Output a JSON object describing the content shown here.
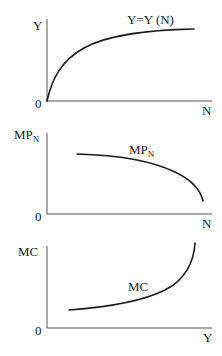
{
  "panels": [
    {
      "id": "production-function",
      "y_axis_label": "Y",
      "x_axis_label": "N",
      "origin_label": "0",
      "curve_label": "Y=Y (N)",
      "curve_shape": "concave increasing"
    },
    {
      "id": "marginal-product-of-labor",
      "y_axis_label": "MP",
      "y_axis_label_sub": "N",
      "x_axis_label": "N",
      "origin_label": "0",
      "curve_label": "MP",
      "curve_label_sub": "N",
      "curve_shape": "decreasing, steepening"
    },
    {
      "id": "marginal-cost",
      "y_axis_label": "MC",
      "x_axis_label": "Y",
      "origin_label": "0",
      "curve_label": "MC",
      "curve_shape": "increasing, convex"
    }
  ],
  "colors": {
    "curve": "#1a1a1a",
    "axis": "#555555",
    "background": "#ffffff"
  }
}
